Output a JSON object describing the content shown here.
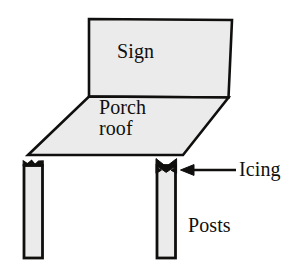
{
  "figure": {
    "kind": "line-diagram",
    "width": 308,
    "height": 276,
    "background_color": "#ffffff",
    "stroke_color": "#100f0e",
    "fill_color": "#ebebeb",
    "labels": {
      "sign": "Sign",
      "porch_roof_line1": "Porch",
      "porch_roof_line2": "roof",
      "icing": "Icing",
      "posts": "Posts"
    },
    "parts": [
      {
        "name": "sign",
        "shape": "quadrilateral",
        "label": "Sign",
        "points": "89,19 232,20 228,98 89,97"
      },
      {
        "name": "porch-roof",
        "shape": "parallelogram",
        "label": "Porch roof",
        "points": "89,97 228,98 183,155 28,155"
      },
      {
        "name": "left-post",
        "shape": "rectangle",
        "label": "Posts",
        "points": "24,165 42,165 42,258 24,258"
      },
      {
        "name": "right-post",
        "shape": "rectangle",
        "label": "Posts",
        "points": "157,165 175,165 175,258 157,258"
      },
      {
        "name": "left-icing-mark",
        "shape": "notch",
        "label": "Icing"
      },
      {
        "name": "right-icing-mark",
        "shape": "bowtie",
        "label": "Icing"
      }
    ],
    "annotations": [
      {
        "name": "icing-arrow",
        "points_to": "right-icing-mark",
        "direction": "left",
        "from_x": 235,
        "to_x": 181,
        "y": 170,
        "label": "Icing"
      }
    ]
  }
}
